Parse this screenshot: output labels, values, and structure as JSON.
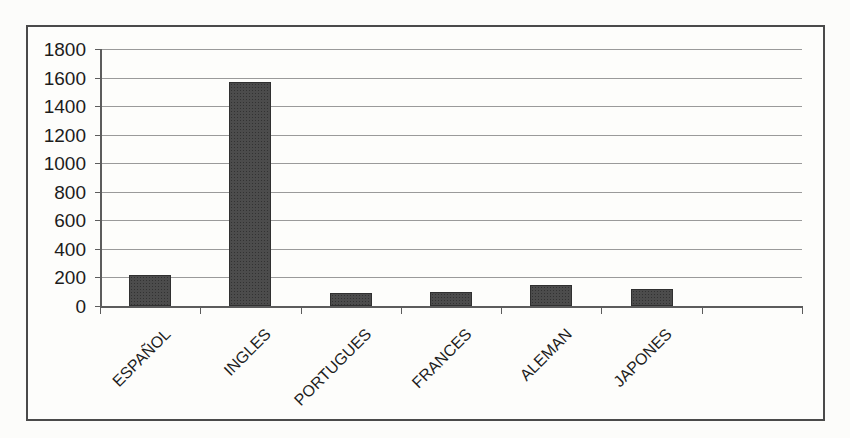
{
  "chart_data": {
    "type": "bar",
    "title": "",
    "xlabel": "",
    "ylabel": "",
    "categories": [
      "ESPAÑOL",
      "INGLES",
      "PORTUGUES",
      "FRANCES",
      "ALEMAN",
      "JAPONES"
    ],
    "values": [
      220,
      1570,
      90,
      95,
      150,
      120
    ],
    "ylim": [
      0,
      1800
    ],
    "ytick_step": 200,
    "ytick_labels": [
      "1800",
      "1600",
      "1400",
      "1200",
      "1000",
      "800",
      "600",
      "400",
      "200",
      "0"
    ],
    "grid": true,
    "legend": "none",
    "layout": {
      "trailing_empty_slots": 1,
      "bar_color": "#454545",
      "bar_border_color": "#303030",
      "gridline_color": "#9a9a9a",
      "axis_color": "#5c5c5c",
      "frame_border_color": "#4a4a4a",
      "text_color": "#1c1c1c",
      "background_color": "#fdfdfb",
      "x_label_rotation_deg": -45
    }
  }
}
